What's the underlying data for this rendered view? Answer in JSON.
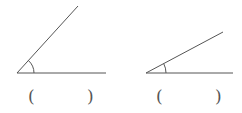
{
  "figures": [
    {
      "name": "angle-1",
      "vertex": [
        17,
        73
      ],
      "ray_horizontal_end": [
        106,
        73
      ],
      "ray_diagonal_end": [
        78,
        6
      ],
      "arc_radius": 17,
      "answer_blank": {
        "open": "(",
        "close": ")"
      }
    },
    {
      "name": "angle-2",
      "vertex": [
        146,
        73
      ],
      "ray_horizontal_end": [
        233,
        73
      ],
      "ray_diagonal_end": [
        223,
        32
      ],
      "arc_radius": 20,
      "answer_blank": {
        "open": "(",
        "close": ")"
      }
    }
  ],
  "colors": {
    "line": "#555555",
    "background": "#ffffff"
  }
}
